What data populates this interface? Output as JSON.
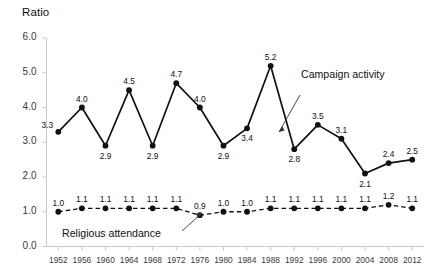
{
  "chart_data": {
    "type": "line",
    "title": "",
    "ylabel": "Ratio",
    "xlabel": "",
    "ylim": [
      0.0,
      6.0
    ],
    "ytick_labels": [
      "0.0",
      "1.0",
      "2.0",
      "3.0",
      "4.0",
      "5.0",
      "6.0"
    ],
    "ytick_values": [
      0.0,
      1.0,
      2.0,
      3.0,
      4.0,
      5.0,
      6.0
    ],
    "grid": false,
    "legend_position": "inline-annotation",
    "categories": [
      "1952",
      "1956",
      "1960",
      "1964",
      "1968",
      "1972",
      "1976",
      "1980",
      "1984",
      "1988",
      "1992",
      "1996",
      "2000",
      "2004",
      "2008",
      "2012"
    ],
    "series": [
      {
        "name": "Campaign activity",
        "style": "solid",
        "color": "#111111",
        "values": [
          3.3,
          4.0,
          2.9,
          4.5,
          2.9,
          4.7,
          4.0,
          2.9,
          3.4,
          5.2,
          2.8,
          3.5,
          3.1,
          2.1,
          2.4,
          2.5
        ],
        "labels": [
          "3.3",
          "4.0",
          "2.9",
          "4.5",
          "2.9",
          "4.7",
          "4.0",
          "2.9",
          "3.4",
          "5.2",
          "2.8",
          "3.5",
          "3.1",
          "2.1",
          "2.4",
          "2.5"
        ],
        "label_positions": [
          "left",
          "above",
          "below",
          "above",
          "below",
          "above",
          "above",
          "below",
          "below",
          "above",
          "below",
          "above",
          "above",
          "below",
          "above",
          "above"
        ]
      },
      {
        "name": "Religious attendance",
        "style": "dashed",
        "color": "#111111",
        "values": [
          1.0,
          1.1,
          1.1,
          1.1,
          1.1,
          1.1,
          0.9,
          1.0,
          1.0,
          1.1,
          1.1,
          1.1,
          1.1,
          1.1,
          1.2,
          1.1
        ],
        "labels": [
          "1.0",
          "1.1",
          "1.1",
          "1.1",
          "1.1",
          "1.1",
          "0.9",
          "1.0",
          "1.0",
          "1.1",
          "1.1",
          "1.1",
          "1.1",
          "1.1",
          "1.2",
          "1.1"
        ],
        "label_positions": [
          "above",
          "above",
          "above",
          "above",
          "above",
          "above",
          "above",
          "above",
          "above",
          "above",
          "above",
          "above",
          "above",
          "above",
          "above",
          "above"
        ]
      }
    ],
    "annotations": [
      {
        "text": "Campaign activity",
        "target_series": "Campaign activity",
        "target_index": 10
      },
      {
        "text": "Religious attendance",
        "target_series": "Religious attendance",
        "target_index": 6
      }
    ]
  }
}
